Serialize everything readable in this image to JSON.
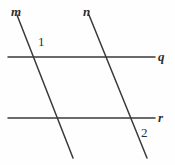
{
  "figure": {
    "background_color": "#fefefe",
    "stroke_color": "#3a3a3a",
    "label_color": "#2e2e2e",
    "width": 175,
    "height": 165
  },
  "labels": {
    "line_m": "m",
    "line_n": "n",
    "line_q": "q",
    "line_r": "r",
    "angle_1": "1",
    "angle_2": "2"
  },
  "geometry": {
    "lines": [
      {
        "name": "m",
        "kind": "transversal",
        "x1": 17,
        "y1": 15,
        "x2": 73,
        "y2": 158
      },
      {
        "name": "n",
        "kind": "transversal",
        "x1": 89,
        "y1": 15,
        "x2": 147,
        "y2": 158
      },
      {
        "name": "q",
        "kind": "horizontal",
        "x1": 8,
        "y1": 57,
        "x2": 155,
        "y2": 57
      },
      {
        "name": "r",
        "kind": "horizontal",
        "x1": 8,
        "y1": 118,
        "x2": 155,
        "y2": 118
      }
    ],
    "stroke_width": 1.5
  }
}
